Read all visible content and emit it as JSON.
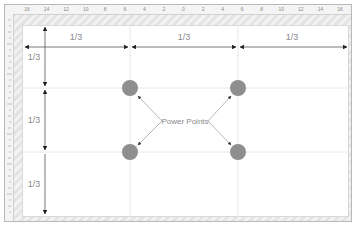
{
  "diagram": {
    "ruler": {
      "top_ticks": [
        "16",
        "14",
        "12",
        "10",
        "8",
        "6",
        "4",
        "2",
        "0",
        "2",
        "4",
        "6",
        "8",
        "10",
        "12",
        "14",
        "16"
      ]
    },
    "columns": [
      {
        "label": "1/3"
      },
      {
        "label": "1/3"
      },
      {
        "label": "1/3"
      }
    ],
    "rows": [
      {
        "label": "1/3"
      },
      {
        "label": "1/3"
      },
      {
        "label": "1/3"
      }
    ],
    "power_points_label": "Power Points",
    "colors": {
      "circle": "#8e8e8e",
      "grid_line": "#e2e2e2",
      "arrow": "#222222",
      "pointer_line": "#9a9a9a",
      "label_text": "#8a8a8a"
    }
  }
}
